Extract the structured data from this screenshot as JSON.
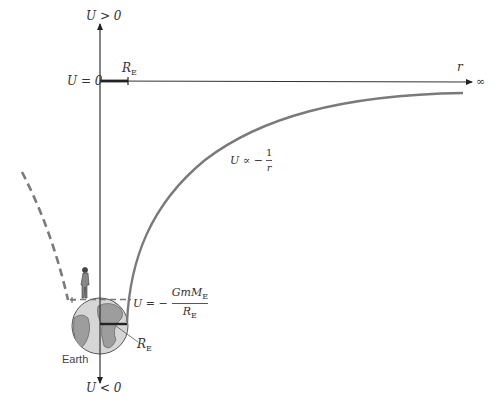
{
  "diagram": {
    "axes": {
      "vertical_top_label": "U > 0",
      "vertical_bottom_label": "U < 0",
      "zero_label": "U = 0",
      "horizontal_label": "r",
      "horizontal_end_label": "∞"
    },
    "labels": {
      "re_axis": {
        "main": "R",
        "sub": "E"
      },
      "re_earth": {
        "main": "R",
        "sub": "E"
      },
      "curve_label": {
        "prefix": "U ∝ −",
        "num": "1",
        "den": "r"
      },
      "surface_value": {
        "prefix": "U = −",
        "num_main": "GmM",
        "num_sub": "E",
        "den_main": "R",
        "den_sub": "E"
      },
      "earth": "Earth"
    },
    "colors": {
      "axis": "#333333",
      "curve": "#777777",
      "dashed": "#777777",
      "earth_land": "#9a9a9a",
      "earth_ocean": "#d4d4d4"
    }
  }
}
